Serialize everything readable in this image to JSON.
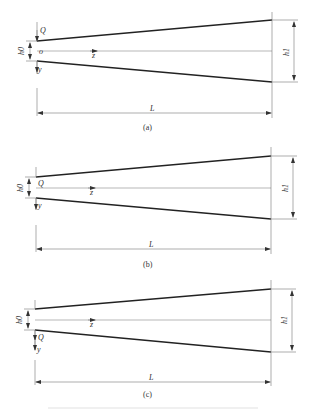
{
  "figure": {
    "panels": [
      {
        "id": "a",
        "caption": "(a)",
        "load_label": "Q",
        "load_position": "top-edge",
        "origin_label": "o",
        "axis_z": "z",
        "axis_y": "y",
        "h0_label": "h0",
        "h1_label": "h1",
        "length_label": "L"
      },
      {
        "id": "b",
        "caption": "(b)",
        "load_label": "Q",
        "load_position": "centerline",
        "axis_z": "z",
        "axis_y": "y",
        "h0_label": "h0",
        "h1_label": "h1",
        "length_label": "L"
      },
      {
        "id": "c",
        "caption": "(c)",
        "load_label": "Q",
        "load_position": "bottom-edge",
        "axis_z": "z",
        "axis_y": "y",
        "h0_label": "h0",
        "h1_label": "h1",
        "length_label": "L"
      }
    ]
  }
}
